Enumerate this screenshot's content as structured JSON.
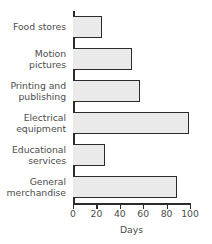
{
  "chart_data": {
    "type": "bar",
    "orientation": "horizontal",
    "title": "",
    "xlabel": "Days",
    "ylabel": "",
    "xlim": [
      0,
      100
    ],
    "xticks": [
      0,
      20,
      40,
      60,
      80,
      100
    ],
    "xticklabels": [
      "0",
      "20",
      "40",
      "60",
      "80",
      "100"
    ],
    "grid": false,
    "legend": null,
    "categories": [
      "Food stores",
      "Motion\npictures",
      "Printing and\npublishing",
      "Electrical\nequipment",
      "Educational\nservices",
      "General\nmerchandise"
    ],
    "values": [
      25,
      50,
      57,
      99,
      27,
      89
    ],
    "bar_fill_color": "#eaeaea",
    "bar_edge_color": "#2b2b2b",
    "text_color": "#4d4d4d",
    "background_color": "#ffffff"
  }
}
